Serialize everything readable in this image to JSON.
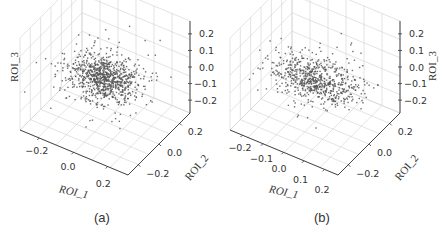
{
  "chart_data": [
    {
      "panel": "(a)",
      "type": "scatter",
      "projection": "3d",
      "title": "",
      "xlabel": "ROI_1",
      "ylabel": "ROI_2",
      "zlabel": "ROI_3",
      "x_ticks": [
        "−0.2",
        "0.0",
        "0.2"
      ],
      "y_ticks": [
        "−0.2",
        "0.0",
        "0.2"
      ],
      "z_ticks": [
        "0.2",
        "0.1",
        "0.0",
        "−0.1",
        "−0.2"
      ],
      "xlim": [
        -0.3,
        0.3
      ],
      "ylim": [
        -0.3,
        0.3
      ],
      "zlim": [
        -0.25,
        0.25
      ],
      "grid": true,
      "point_color": "#555555",
      "n_points": 900,
      "distribution": {
        "center": [
          0.0,
          0.0,
          -0.02
        ],
        "spread": [
          0.09,
          0.08,
          0.03
        ],
        "outlier_fraction": 0.12
      },
      "zlabel_position": "left"
    },
    {
      "panel": "(b)",
      "type": "scatter",
      "projection": "3d",
      "title": "",
      "xlabel": "ROI_1",
      "ylabel": "ROI_2",
      "zlabel": "ROI_3",
      "x_ticks": [
        "−0.2",
        "−0.1",
        "0.0",
        "0.1",
        "0.2"
      ],
      "y_ticks": [
        "−0.2",
        "0.0",
        "0.2"
      ],
      "z_ticks": [
        "0.2",
        "0.1",
        "0.0",
        "−0.1",
        "−0.2"
      ],
      "xlim": [
        -0.25,
        0.25
      ],
      "ylim": [
        -0.3,
        0.3
      ],
      "zlim": [
        -0.25,
        0.25
      ],
      "grid": true,
      "point_color": "#555555",
      "n_points": 700,
      "distribution": {
        "center": [
          0.0,
          0.0,
          -0.02
        ],
        "spread": [
          0.09,
          0.07,
          0.03
        ],
        "outlier_fraction": 0.15
      },
      "zlabel_position": "right"
    }
  ],
  "captions": [
    "(a)",
    "(b)"
  ]
}
